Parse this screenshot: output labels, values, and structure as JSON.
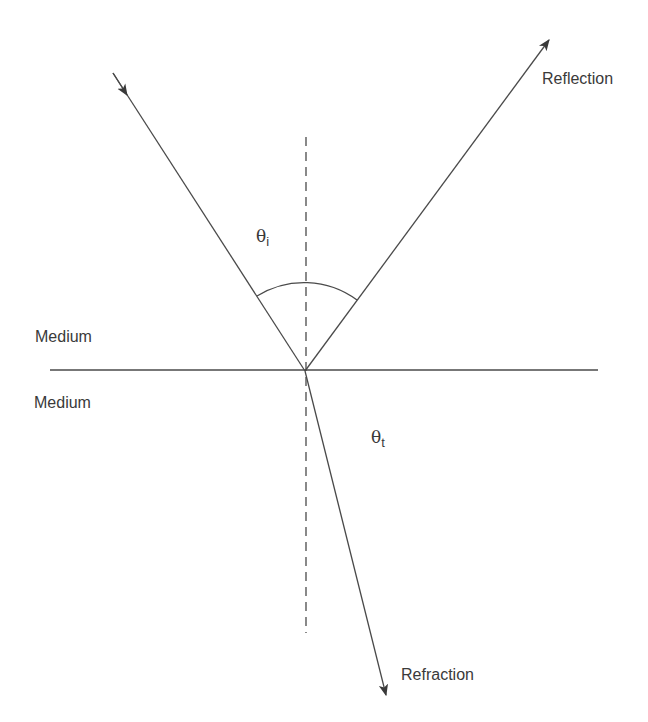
{
  "diagram": {
    "title": "",
    "labels": {
      "reflection": "Reflection",
      "refraction": "Refraction",
      "medium_top": "Medium",
      "medium_bottom": "Medium",
      "theta_symbol": "θ",
      "theta_incident_sub": "i",
      "theta_transmitted_sub": "t"
    },
    "colors": {
      "line": "#4a4a4a",
      "text": "#3a3a3a",
      "background": "#ffffff"
    },
    "geometry": {
      "interface": {
        "x1": 50,
        "y1": 370,
        "x2": 598,
        "y2": 370
      },
      "normal": {
        "x1": 306,
        "y1": 137,
        "x2": 306,
        "y2": 633,
        "style": "dashed"
      },
      "incident_ray": {
        "x1": 113,
        "y1": 73,
        "x2": 305,
        "y2": 371,
        "arrow": "toward-interface"
      },
      "reflected_ray": {
        "x1": 305,
        "y1": 371,
        "x2": 549,
        "y2": 40,
        "arrow": "outward"
      },
      "refracted_ray": {
        "x1": 305,
        "y1": 371,
        "x2": 386,
        "y2": 695,
        "arrow": "outward"
      },
      "angle_arc": {
        "cx": 305,
        "cy": 371,
        "r": 89,
        "from": [
          257,
          296
        ],
        "to": [
          357,
          300
        ]
      }
    }
  }
}
